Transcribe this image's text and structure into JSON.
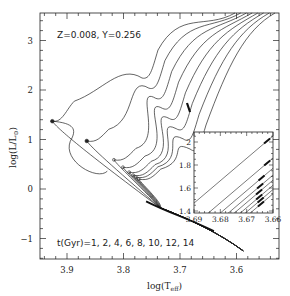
{
  "chart_data": {
    "type": "line",
    "title": "",
    "annotation_top": "Z=0.008, Y=0.256",
    "annotation_bottom": "t(Gyr)=1, 2, 4, 6, 8, 10, 12, 14",
    "xlabel": "log(T_eff)",
    "ylabel": "log(L/L_sun)",
    "xlabel_main": "log(T",
    "xlabel_sub": "eff",
    "xlabel_end": ")",
    "ylabel_main": "log(L/L",
    "ylabel_sub": "⊙",
    "ylabel_end": ")",
    "x_reversed": true,
    "xlim": [
      3.948,
      3.525
    ],
    "ylim": [
      -1.4,
      3.55
    ],
    "xticks": [
      3.9,
      3.8,
      3.7,
      3.6
    ],
    "xtick_labels": [
      "3.9",
      "3.8",
      "3.7",
      "3.6"
    ],
    "yticks": [
      -1,
      0,
      1,
      2,
      3
    ],
    "ytick_labels": [
      "−1",
      "0",
      "1",
      "2",
      "3"
    ],
    "grid": false,
    "legend": "none",
    "series": [
      {
        "name": "1 Gyr",
        "turnoff": [
          3.926,
          1.37
        ]
      },
      {
        "name": "2 Gyr",
        "turnoff": [
          3.865,
          0.97
        ]
      },
      {
        "name": "4 Gyr",
        "turnoff": [
          3.817,
          0.59
        ]
      },
      {
        "name": "6 Gyr",
        "turnoff": [
          3.801,
          0.44
        ]
      },
      {
        "name": "8 Gyr",
        "turnoff": [
          3.79,
          0.34
        ]
      },
      {
        "name": "10 Gyr",
        "turnoff": [
          3.783,
          0.28
        ]
      },
      {
        "name": "12 Gyr",
        "turnoff": [
          3.778,
          0.24
        ]
      },
      {
        "name": "14 Gyr",
        "turnoff": [
          3.773,
          0.2
        ]
      }
    ],
    "main_sequence_end": [
      3.588,
      -1.25
    ],
    "inset": {
      "xlim": [
        3.69,
        3.66
      ],
      "ylim": [
        1.4,
        2.08
      ],
      "xticks": [
        3.69,
        3.68,
        3.67,
        3.66
      ],
      "xtick_labels": [
        "3.69",
        "3.68",
        "3.67",
        "3.66"
      ],
      "yticks": [
        1.4,
        1.6,
        1.8,
        2.0
      ],
      "ytick_labels": [
        "1.4",
        "1.6",
        "1.8",
        "2"
      ],
      "description": "Zoom on red giant branch bump region; thickened segments mark RGB bump for each isochrone"
    }
  }
}
